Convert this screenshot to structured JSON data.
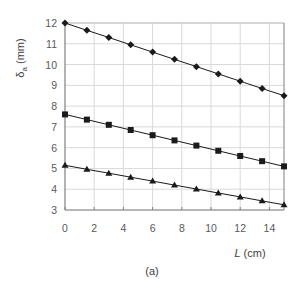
{
  "chart_data": {
    "type": "line",
    "title": "",
    "xlabel": "L (cm)",
    "xlabel_var": "L",
    "xlabel_unit": " (cm)",
    "ylabel": "δa (mm)",
    "ylabel_symbol": "δ",
    "ylabel_sub": "a",
    "ylabel_unit": " (mm)",
    "caption": "(a)",
    "xlim": [
      0,
      15
    ],
    "ylim": [
      3,
      12
    ],
    "xticks": [
      0,
      2,
      4,
      6,
      8,
      10,
      12,
      14
    ],
    "yticks": [
      3,
      4,
      5,
      6,
      7,
      8,
      9,
      10,
      11,
      12
    ],
    "grid": true,
    "legend": null,
    "x": [
      0,
      1.5,
      3,
      4.5,
      6,
      7.5,
      9,
      10.5,
      12,
      13.5,
      15
    ],
    "series": [
      {
        "name": "diamond",
        "marker": "diamond",
        "values": [
          12.0,
          11.65,
          11.3,
          10.95,
          10.6,
          10.25,
          9.9,
          9.55,
          9.2,
          8.85,
          8.5
        ]
      },
      {
        "name": "square",
        "marker": "square",
        "values": [
          7.6,
          7.35,
          7.1,
          6.85,
          6.6,
          6.35,
          6.1,
          5.85,
          5.6,
          5.35,
          5.1
        ]
      },
      {
        "name": "triangle",
        "marker": "triangle",
        "values": [
          5.15,
          4.96,
          4.77,
          4.58,
          4.39,
          4.2,
          4.01,
          3.82,
          3.63,
          3.44,
          3.25
        ]
      }
    ],
    "colors": {
      "line": "#1a1a1a",
      "grid": "#d9d9d9",
      "axis": "#808080",
      "text": "#595959"
    }
  }
}
